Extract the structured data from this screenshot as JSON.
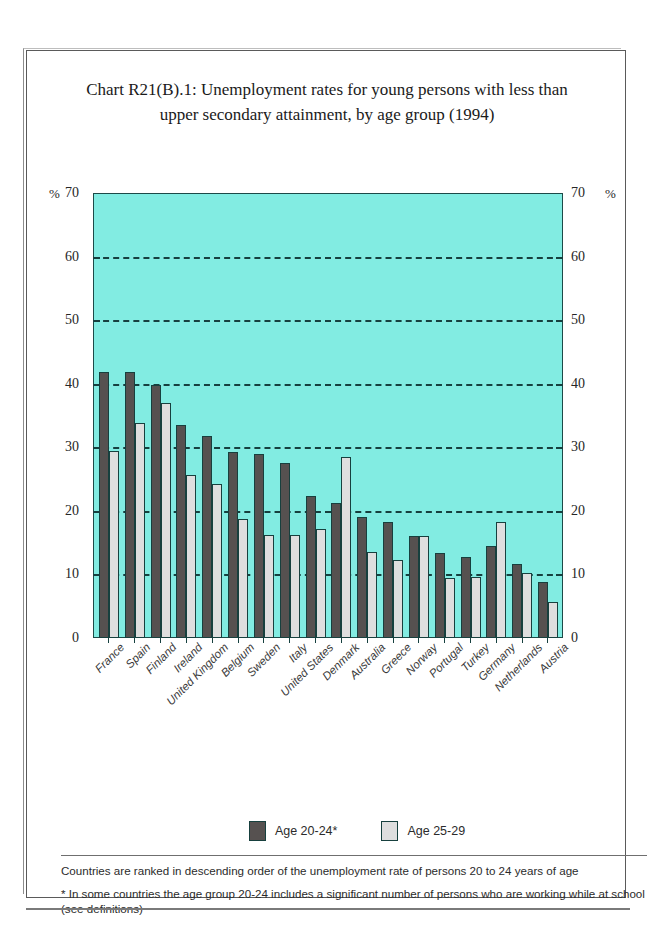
{
  "chart_title": "Chart R21(B).1: Unemployment rates for young persons with less than upper secondary attainment, by age group (1994)",
  "axis": {
    "percent_symbol_left": "%",
    "percent_symbol_right": "%",
    "yticks": [
      70,
      60,
      50,
      40,
      30,
      20,
      10,
      0
    ]
  },
  "legend": {
    "items": [
      {
        "label": "Age 20-24*",
        "color": "#565150",
        "key": "age_20_24"
      },
      {
        "label": "Age 25-29",
        "color": "#dedede",
        "key": "age_25_29"
      }
    ]
  },
  "footnotes": [
    "Countries are ranked in descending order of the unemployment rate of persons 20 to 24 years of age",
    "*  In some countries the age group 20-24 includes a significant number of persons who are working while at school (see definitions)"
  ],
  "chart_data": {
    "type": "bar",
    "title": "Chart R21(B).1: Unemployment rates for young persons with less than upper secondary attainment, by age group (1994)",
    "xlabel": "",
    "ylabel": "%",
    "ylim": [
      0,
      70
    ],
    "ytick_step": 10,
    "grid": true,
    "legend_position": "bottom",
    "categories": [
      "France",
      "Spain",
      "Finland",
      "Ireland",
      "United Kingdom",
      "Belgium",
      "Sweden",
      "Italy",
      "United States",
      "Denmark",
      "Australia",
      "Greece",
      "Norway",
      "Portugal",
      "Turkey",
      "Germany",
      "Netherlands",
      "Austria"
    ],
    "series": [
      {
        "name": "Age 20-24*",
        "color": "#565150",
        "values": [
          41.8,
          41.8,
          39.8,
          33.5,
          31.7,
          29.3,
          28.9,
          27.6,
          22.4,
          21.2,
          19.1,
          18.3,
          16.1,
          13.3,
          12.8,
          14.5,
          11.7,
          8.8
        ]
      },
      {
        "name": "Age 25-29",
        "color": "#dedede",
        "values": [
          29.4,
          33.9,
          37.0,
          25.7,
          24.3,
          18.7,
          16.2,
          16.2,
          17.2,
          28.4,
          13.6,
          12.2,
          16.0,
          9.4,
          9.6,
          18.3,
          10.2,
          5.7
        ]
      }
    ]
  }
}
